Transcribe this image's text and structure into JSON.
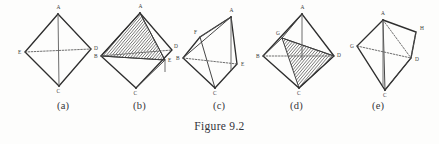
{
  "figure": {
    "title": "Figure 9.2",
    "panel_width": 88,
    "panel_height": 100
  },
  "panels": [
    {
      "caption": "(a)",
      "caption_x": 57,
      "left": 14,
      "description": "bipyramid-plain",
      "vertices": [
        {
          "label": "A",
          "x": 44,
          "y": 14,
          "lx": 42.5,
          "ly": 9
        },
        {
          "label": "E",
          "x": 11,
          "y": 52,
          "lx": 4,
          "ly": 54
        },
        {
          "label": "D",
          "x": 77,
          "y": 49,
          "lx": 80,
          "ly": 50
        },
        {
          "label": "C",
          "x": 45,
          "y": 86,
          "lx": 42.5,
          "ly": 93
        }
      ]
    },
    {
      "caption": "(b)",
      "caption_x": 133,
      "left": 92,
      "description": "bipyramid-hatched-triangle",
      "vertices": [
        {
          "label": "A",
          "x": 48,
          "y": 13,
          "lx": 46.5,
          "ly": 8
        },
        {
          "label": "B",
          "x": 9,
          "y": 56,
          "lx": 2,
          "ly": 58
        },
        {
          "label": "E",
          "x": 73,
          "y": 60,
          "lx": 76,
          "ly": 62
        },
        {
          "label": "C",
          "x": 44,
          "y": 88,
          "lx": 41.5,
          "ly": 95
        },
        {
          "label": "D",
          "x": 80,
          "y": 50,
          "lx": 82,
          "ly": 48
        }
      ]
    },
    {
      "caption": "(c)",
      "caption_x": 213,
      "left": 173,
      "description": "tilted-tetrahedron",
      "vertices": [
        {
          "label": "A",
          "x": 58,
          "y": 17,
          "lx": 56.5,
          "ly": 12
        },
        {
          "label": "F",
          "x": 27,
          "y": 37,
          "lx": 21,
          "ly": 34
        },
        {
          "label": "B",
          "x": 10,
          "y": 58,
          "lx": 3,
          "ly": 60
        },
        {
          "label": "E",
          "x": 64,
          "y": 64,
          "lx": 68,
          "ly": 66
        },
        {
          "label": "C",
          "x": 42,
          "y": 88,
          "lx": 40,
          "ly": 95
        }
      ]
    },
    {
      "caption": "(d)",
      "caption_x": 290,
      "left": 255,
      "description": "bipyramid-hatched-quad",
      "vertices": [
        {
          "label": "A",
          "x": 47,
          "y": 14,
          "lx": 45.5,
          "ly": 9
        },
        {
          "label": "G",
          "x": 27,
          "y": 38,
          "lx": 21,
          "ly": 35
        },
        {
          "label": "B",
          "x": 8,
          "y": 56,
          "lx": 1,
          "ly": 58
        },
        {
          "label": "D",
          "x": 79,
          "y": 56,
          "lx": 82,
          "ly": 57
        },
        {
          "label": "C",
          "x": 44,
          "y": 88,
          "lx": 42,
          "ly": 95
        }
      ]
    },
    {
      "caption": "(e)",
      "caption_x": 372,
      "left": 345,
      "description": "tetrahedron-with-H",
      "vertices": [
        {
          "label": "A",
          "x": 38,
          "y": 20,
          "lx": 36,
          "ly": 15
        },
        {
          "label": "H",
          "x": 71,
          "y": 32,
          "lx": 75,
          "ly": 30
        },
        {
          "label": "G",
          "x": 12,
          "y": 46,
          "lx": 5,
          "ly": 48
        },
        {
          "label": "D",
          "x": 66,
          "y": 58,
          "lx": 70,
          "ly": 61
        },
        {
          "label": "C",
          "x": 40,
          "y": 90,
          "lx": 38,
          "ly": 97
        }
      ]
    }
  ],
  "colors": {
    "background": "#fdfdfc",
    "ink": "#2f2f2f",
    "hatch": "#3a3a3a",
    "dashed": "#555555"
  }
}
